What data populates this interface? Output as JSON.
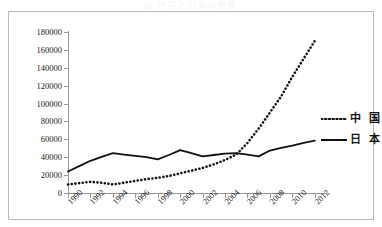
{
  "title_strip": "図 中国と日本の推移",
  "legend": {
    "position": "right",
    "items": [
      {
        "label": "中 国",
        "style": "dotted",
        "color": "#111111"
      },
      {
        "label": "日 本",
        "style": "solid",
        "color": "#111111"
      }
    ]
  },
  "axes": {
    "y_ticks": [
      "0",
      "20000",
      "40000",
      "60000",
      "80000",
      "100000",
      "120000",
      "140000",
      "160000",
      "180000"
    ],
    "x_ticks": [
      "1990",
      "1992",
      "1994",
      "1996",
      "1998",
      "2000",
      "2002",
      "2004",
      "2006",
      "2008",
      "2010",
      "2012"
    ]
  },
  "chart_data": {
    "type": "line",
    "title": "",
    "xlabel": "",
    "ylabel": "",
    "grid": false,
    "legend_position": "right",
    "ylim": [
      0,
      180000
    ],
    "xlim": [
      1990,
      2013
    ],
    "x": [
      1990,
      1991,
      1992,
      1993,
      1994,
      1995,
      1996,
      1997,
      1998,
      1999,
      2000,
      2001,
      2002,
      2003,
      2004,
      2005,
      2006,
      2007,
      2008,
      2009,
      2010,
      2011,
      2012
    ],
    "series": [
      {
        "name": "中 国",
        "style": "dotted",
        "color": "#111111",
        "values": [
          9500,
          11000,
          12500,
          11500,
          9500,
          11500,
          13500,
          15500,
          17000,
          19000,
          22000,
          25000,
          28000,
          32000,
          37000,
          43000,
          56000,
          72000,
          90000,
          108000,
          130000,
          150000,
          170000
        ]
      },
      {
        "name": "日 本",
        "style": "solid",
        "color": "#111111",
        "values": [
          24000,
          30000,
          36000,
          40500,
          44500,
          43000,
          41500,
          40000,
          37500,
          42500,
          48000,
          44500,
          41000,
          42500,
          44000,
          44500,
          43000,
          41000,
          47500,
          50500,
          53000,
          56000,
          58500
        ]
      }
    ]
  }
}
